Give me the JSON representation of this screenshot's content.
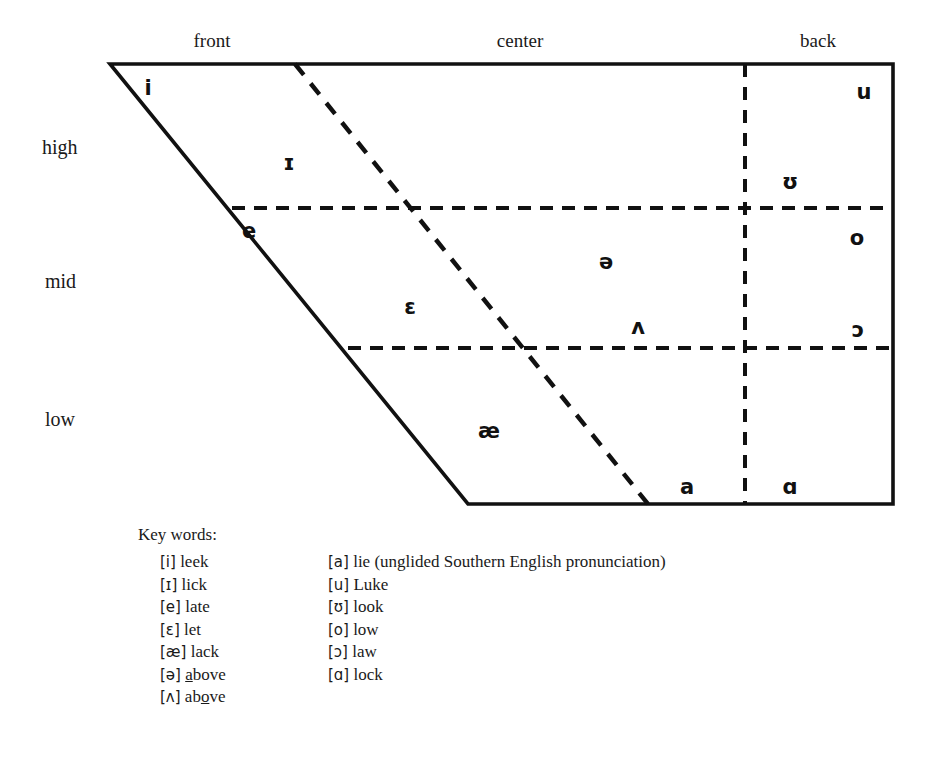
{
  "figure": {
    "type": "vowel-quadrilateral-diagram",
    "column_headings": [
      {
        "name": "front",
        "label": "front"
      },
      {
        "name": "center",
        "label": "center"
      },
      {
        "name": "back",
        "label": "back"
      }
    ],
    "row_labels": [
      {
        "name": "high",
        "label": "high"
      },
      {
        "name": "mid",
        "label": "mid"
      },
      {
        "name": "low",
        "label": "low"
      }
    ],
    "vowels": [
      {
        "symbol": "i",
        "row": "high",
        "column": "front",
        "x": 148,
        "y": 88
      },
      {
        "symbol": "ɪ",
        "row": "high",
        "column": "front",
        "x": 289,
        "y": 163
      },
      {
        "symbol": "u",
        "row": "high",
        "column": "back",
        "x": 864,
        "y": 92
      },
      {
        "symbol": "ʊ",
        "row": "high",
        "column": "back",
        "x": 790,
        "y": 182
      },
      {
        "symbol": "e",
        "row": "mid",
        "column": "front",
        "x": 249,
        "y": 231
      },
      {
        "symbol": "ɛ",
        "row": "mid",
        "column": "front",
        "x": 410,
        "y": 307
      },
      {
        "symbol": "ə",
        "row": "mid",
        "column": "center",
        "x": 606,
        "y": 262
      },
      {
        "symbol": "ʌ",
        "row": "mid",
        "column": "center",
        "x": 638,
        "y": 327
      },
      {
        "symbol": "o",
        "row": "mid",
        "column": "back",
        "x": 857,
        "y": 238
      },
      {
        "symbol": "ɔ",
        "row": "mid",
        "column": "back",
        "x": 858,
        "y": 330
      },
      {
        "symbol": "æ",
        "row": "low",
        "column": "front",
        "x": 489,
        "y": 431
      },
      {
        "symbol": "a",
        "row": "low",
        "column": "center",
        "x": 687,
        "y": 487
      },
      {
        "symbol": "ɑ",
        "row": "low",
        "column": "back",
        "x": 790,
        "y": 487
      }
    ],
    "key_words": {
      "title": "Key words:",
      "left_column": [
        {
          "ipa": "[i]",
          "word": "leek",
          "word_html": "leek"
        },
        {
          "ipa": "[ɪ]",
          "word": "lick",
          "word_html": "lick"
        },
        {
          "ipa": "[e]",
          "word": "late",
          "word_html": "late"
        },
        {
          "ipa": "[ɛ]",
          "word": "let",
          "word_html": "let"
        },
        {
          "ipa": "[æ]",
          "word": "lack",
          "word_html": "lack"
        },
        {
          "ipa": "[ə]",
          "word": "above",
          "word_html": "<u>a</u>bove"
        },
        {
          "ipa": "[ʌ]",
          "word": "above",
          "word_html": "ab<u>o</u>ve"
        }
      ],
      "right_column": [
        {
          "ipa": "[a]",
          "word": "lie (unglided Southern English pronunciation)",
          "word_html": "lie (unglided Southern English pronunciation)"
        },
        {
          "ipa": "[u]",
          "word": "Luke",
          "word_html": "Luke"
        },
        {
          "ipa": "[ʊ]",
          "word": "look",
          "word_html": "look"
        },
        {
          "ipa": "[o]",
          "word": "low",
          "word_html": "low"
        },
        {
          "ipa": "[ɔ]",
          "word": "law",
          "word_html": "law"
        },
        {
          "ipa": "[ɑ]",
          "word": "lock",
          "word_html": "lock"
        }
      ]
    },
    "colors": {
      "stroke": "#111111",
      "text": "#1a1a1a",
      "background": "#ffffff"
    },
    "geometry": {
      "top_left": {
        "x": 110,
        "y": 64
      },
      "top_right": {
        "x": 893,
        "y": 64
      },
      "bottom_right": {
        "x": 893,
        "y": 504
      },
      "bottom_left": {
        "x": 468,
        "y": 504
      },
      "dashed_row_lines_y": [
        208,
        348
      ],
      "dashed_front_center_divider": {
        "x1": 295,
        "y1": 64,
        "x2": 648,
        "y2": 504
      },
      "dashed_center_back_divider_x": 745
    }
  }
}
